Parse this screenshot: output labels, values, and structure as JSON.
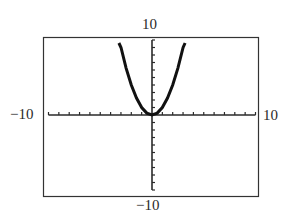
{
  "chart_data": {
    "type": "line",
    "title": "",
    "function": "y = x^2",
    "xlabel": "",
    "ylabel": "",
    "xlim": [
      -10,
      10
    ],
    "ylim": [
      -10,
      10
    ],
    "xscale": 1,
    "yscale": 1,
    "grid": false,
    "window_labels": {
      "xmin": "−10",
      "xmax": "10",
      "ymin": "−10",
      "ymax": "10"
    },
    "series": [
      {
        "name": "y = x^2",
        "x": [
          -3.2,
          -3,
          -2.5,
          -2,
          -1.5,
          -1,
          -0.5,
          0,
          0.5,
          1,
          1.5,
          2,
          2.5,
          3,
          3.2
        ],
        "y": [
          10.24,
          9,
          6.25,
          4,
          2.25,
          1,
          0.25,
          0,
          0.25,
          1,
          2.25,
          4,
          6.25,
          9,
          10.24
        ]
      }
    ]
  },
  "colors": {
    "axis": "#2a2a2a",
    "curve": "#111111",
    "frame": "#333333",
    "background": "#ffffff"
  }
}
